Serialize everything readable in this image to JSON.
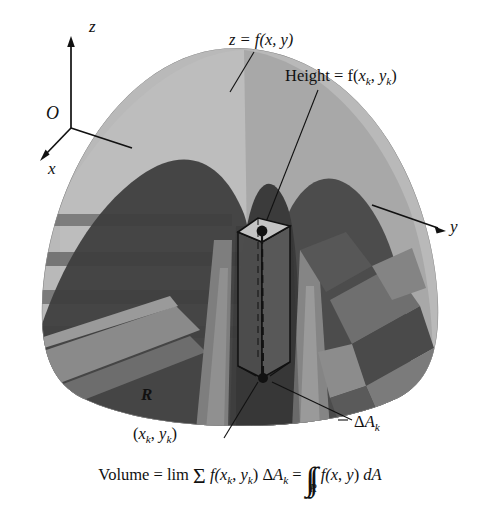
{
  "figure": {
    "background": "#ffffff"
  },
  "axes": {
    "z_label": "z",
    "x_label": "x",
    "y_label": "y",
    "origin_label": "O"
  },
  "annotations": {
    "surface_equation": "z = f(x, y)",
    "height_prefix": "Height = f(",
    "height_x": "x",
    "height_k1": "k",
    "height_comma": ", ",
    "height_y": "y",
    "height_k2": "k",
    "height_suffix": ")",
    "region_label": "R",
    "sample_point_open": "(",
    "sample_point_x": "x",
    "sample_point_k1": "k",
    "sample_point_comma": ", ",
    "sample_point_y": "y",
    "sample_point_k2": "k",
    "sample_point_close": ")",
    "area_delta": "Δ",
    "area_A": "A",
    "area_k": "k"
  },
  "formula": {
    "volume_word": "Volume",
    "equals_1": " = ",
    "lim": "lim",
    "sigma": "Σ",
    "f_open": " f(",
    "fx": "x",
    "fk1": "k",
    "fcomma": ", ",
    "fy": "y",
    "fk2": "k",
    "f_close": ") ",
    "delta": "Δ",
    "A": "A",
    "Ak": "k",
    "equals_2": " = ",
    "integral_glyph": "∫∫",
    "integral_sub": "R",
    "integrand_open": " f(",
    "integrand_x": "x",
    "integrand_comma": ", ",
    "integrand_y": "y",
    "integrand_close": ") ",
    "d": "d",
    "dA": "A"
  },
  "colors": {
    "surface_light": "#b9b9b9",
    "surface_light2": "#a9a9a9",
    "surface_mid": "#8d8d8d",
    "surface_mid2": "#6e6e6e",
    "surface_dark": "#4a4a4a",
    "surface_darker": "#3a3a3a",
    "surface_darkest": "#2f2f2f",
    "prism_face": "#555555",
    "prism_top": "#c8c8c8",
    "line": "#111111",
    "text": "#111111"
  }
}
